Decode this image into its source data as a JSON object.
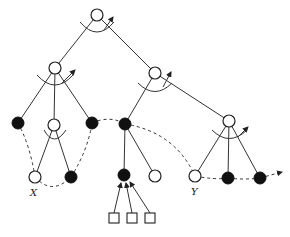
{
  "diagram": {
    "type": "tree",
    "labels": {
      "x": "X",
      "y": "Y"
    },
    "nodes": [
      {
        "id": "root",
        "kind": "open",
        "x": 97,
        "y": 15
      },
      {
        "id": "a",
        "kind": "open",
        "x": 55,
        "y": 68
      },
      {
        "id": "b",
        "kind": "open",
        "x": 155,
        "y": 73
      },
      {
        "id": "a1",
        "kind": "filled",
        "x": 18,
        "y": 123
      },
      {
        "id": "a2",
        "kind": "open",
        "x": 54,
        "y": 125
      },
      {
        "id": "a3",
        "kind": "filled",
        "x": 92,
        "y": 123
      },
      {
        "id": "x",
        "kind": "open",
        "x": 35,
        "y": 177,
        "label": "X"
      },
      {
        "id": "a22",
        "kind": "filled",
        "x": 71,
        "y": 177
      },
      {
        "id": "b1",
        "kind": "filled",
        "x": 125,
        "y": 124
      },
      {
        "id": "b2",
        "kind": "open",
        "x": 229,
        "y": 121
      },
      {
        "id": "b11",
        "kind": "filled",
        "x": 124,
        "y": 175
      },
      {
        "id": "b12",
        "kind": "open",
        "x": 155,
        "y": 176
      },
      {
        "id": "y",
        "kind": "open",
        "x": 195,
        "y": 176,
        "label": "Y"
      },
      {
        "id": "b22",
        "kind": "filled",
        "x": 228,
        "y": 178
      },
      {
        "id": "b23",
        "kind": "filled",
        "x": 260,
        "y": 178
      }
    ],
    "leaf_squares": [
      {
        "x": 114,
        "y": 218
      },
      {
        "x": 132,
        "y": 218
      },
      {
        "x": 150,
        "y": 218
      }
    ]
  }
}
